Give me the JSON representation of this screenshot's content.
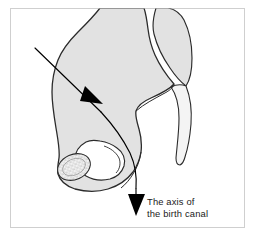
{
  "figure": {
    "title_not_shown": "",
    "canvas": {
      "width": 255,
      "height": 240,
      "background": "#ffffff"
    },
    "frame": {
      "name": "figure-border",
      "x": 10,
      "y": 8,
      "width": 235,
      "height": 220,
      "stroke": "#cfcfcf",
      "stroke_width": 1,
      "fill": "#ffffff"
    },
    "colors": {
      "bone_fill": "#e2e2e2",
      "bone_outline": "#2b2b2b",
      "foramen_fill": "#ffffff",
      "arrow": "#000000",
      "text": "#1a1a1a",
      "border": "#cfcfcf",
      "stipple": "#6b6b6b"
    },
    "label": {
      "name": "axis-of-birth-canal-label",
      "line1": "The axis of",
      "line2": "the birth canal",
      "x": 147,
      "y1": 205,
      "y2": 217
    },
    "parts": [
      {
        "name": "innominate-bone",
        "label": "innominate bone (hip bone)"
      },
      {
        "name": "sacrum",
        "label": "sacrum"
      },
      {
        "name": "coccyx",
        "label": "coccyx"
      },
      {
        "name": "obturator-foramen",
        "label": "obturator foramen"
      },
      {
        "name": "ischial-tuberosity",
        "label": "ischial tuberosity"
      }
    ],
    "arrow": {
      "name": "birth-canal-axis-arrow",
      "description": "curved axis arrow entering at upper left and exiting downward at the pelvic outlet",
      "head_count": 2
    }
  }
}
